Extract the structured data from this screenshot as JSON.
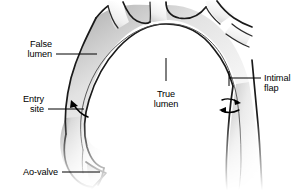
{
  "figure": {
    "background_color": "#ffffff",
    "line_color": "#1a1a1a",
    "text_color": "#000000",
    "shading_color": "#d9d9d9",
    "width": 303,
    "height": 190
  },
  "labels": [
    {
      "id": "false-lumen",
      "lines": [
        "False",
        "lumen"
      ],
      "line1": "False",
      "line2": "lumen",
      "align": "right",
      "text_x": 52,
      "line1_y": 47,
      "line2_y": 57,
      "leader": {
        "x1": 56,
        "y1": 54,
        "x2": 97,
        "y2": 54
      }
    },
    {
      "id": "entry-site",
      "lines": [
        "Entry",
        "site"
      ],
      "line1": "Entry",
      "line2": "site",
      "align": "right",
      "text_x": 44,
      "line1_y": 102,
      "line2_y": 112,
      "leader": {
        "x1": 48,
        "y1": 109,
        "x2": 84,
        "y2": 109
      }
    },
    {
      "id": "ao-valve",
      "lines": [
        "Ao-valve"
      ],
      "line1": "Ao-valve",
      "line2": "",
      "align": "right",
      "text_x": 58,
      "line1_y": 175,
      "line2_y": 175,
      "leader": {
        "x1": 62,
        "y1": 172,
        "x2": 100,
        "y2": 172
      }
    },
    {
      "id": "true-lumen",
      "lines": [
        "True",
        "lumen"
      ],
      "line1": "True",
      "line2": "lumen",
      "align": "middle",
      "text_x": 166,
      "line1_y": 97,
      "line2_y": 107,
      "leader": {
        "x1": 166,
        "y1": 58,
        "x2": 166,
        "y2": 81
      }
    },
    {
      "id": "intimal-flap",
      "lines": [
        "Intimal",
        "flap"
      ],
      "line1": "Intimal",
      "line2": "flap",
      "align": "left",
      "text_x": 264,
      "line1_y": 81,
      "line2_y": 91,
      "leader": {
        "x1": 229,
        "y1": 78,
        "x2": 261,
        "y2": 78
      }
    }
  ],
  "annotations": {
    "entry_site_arrow": "curved-arrow-into-false-lumen",
    "flap_flow_arrow_upper": "arrow-pointing-right",
    "flap_flow_arrow_lower": "arrow-pointing-left",
    "intimal_flap_tick": "vertical-tick-at-vessel-wall"
  },
  "anatomy": {
    "structures": [
      "ascending aorta",
      "aortic arch",
      "descending aorta",
      "brachiocephalic trunk",
      "left common carotid artery",
      "left subclavian artery",
      "aortic valve leaflet",
      "intimal flap",
      "true lumen",
      "false lumen",
      "entry site tear"
    ]
  }
}
